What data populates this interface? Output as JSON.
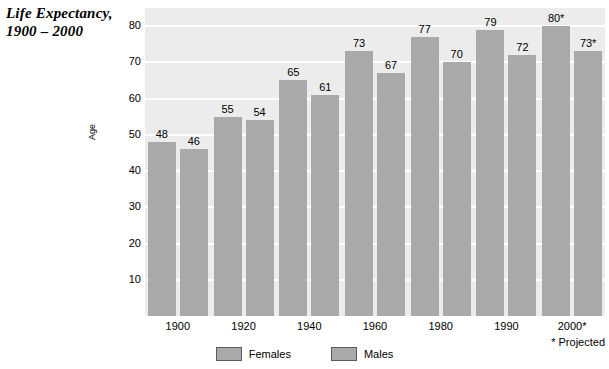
{
  "title": "Life Expectancy,\n1900 – 2000",
  "footnote": "* Projected",
  "axes": {
    "y_title": "Age",
    "y_ticks": [
      "80",
      "70",
      "60",
      "50",
      "40",
      "30",
      "20",
      "10"
    ]
  },
  "legend": {
    "items": [
      {
        "label": "Females",
        "color": "#a9a9a9"
      },
      {
        "label": "Males",
        "color": "#a9a9a9"
      }
    ]
  },
  "chart_data": {
    "type": "bar",
    "title": "Life Expectancy, 1900 – 2000",
    "xlabel": "",
    "ylabel": "Age",
    "ylim": [
      0,
      85
    ],
    "grid": true,
    "legend_position": "bottom-center",
    "categories": [
      "1900",
      "1920",
      "1940",
      "1960",
      "1980",
      "1990",
      "2000*"
    ],
    "series": [
      {
        "name": "Females",
        "color": "#a9a9a9",
        "values": [
          48,
          55,
          65,
          73,
          77,
          79,
          80
        ],
        "labels": [
          "48",
          "55",
          "65",
          "73",
          "77",
          "79",
          "80*"
        ]
      },
      {
        "name": "Males",
        "color": "#a9a9a9",
        "values": [
          46,
          54,
          61,
          67,
          70,
          72,
          73
        ],
        "labels": [
          "46",
          "54",
          "61",
          "67",
          "70",
          "72",
          "73*"
        ]
      }
    ],
    "annotations": [
      "* Projected"
    ]
  }
}
